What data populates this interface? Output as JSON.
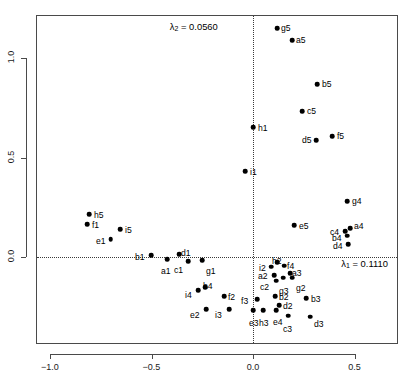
{
  "chart_data": {
    "type": "scatter",
    "title": "",
    "xlabel": "",
    "ylabel": "",
    "xlim": [
      -1.07,
      0.715
    ],
    "ylim": [
      -0.44,
      1.22
    ],
    "xticks": [
      -1.0,
      -0.5,
      0.0,
      0.5
    ],
    "xticklabels": [
      "-1.0",
      "-0.5",
      "0.0",
      "0.5"
    ],
    "yticks": [
      0.0,
      0.5,
      1.0
    ],
    "yticklabels": [
      "0.0",
      "0.5",
      "1.0"
    ],
    "grid": false,
    "reference_lines": {
      "vertical_x": 0.0,
      "horizontal_y": 0.0,
      "style": "dotted"
    },
    "annotations": [
      {
        "name": "lambda2",
        "text": "λ₂ = 0.0560",
        "x": -0.055,
        "y": 1.155,
        "align": "right"
      },
      {
        "name": "lambda1",
        "text": "λ₁ = 0.1110",
        "x": 0.435,
        "y": -0.035,
        "align": "left"
      }
    ],
    "point_labels": [
      "a1",
      "b1",
      "c1",
      "d1",
      "e1",
      "f1",
      "g1",
      "h5",
      "i5",
      "a2",
      "b2",
      "c2",
      "d2",
      "e2",
      "f2",
      "g2",
      "h2",
      "i2",
      "a3",
      "b3",
      "c3",
      "d3",
      "e3",
      "f3",
      "g3",
      "h3",
      "i3",
      "a4",
      "b4",
      "c4",
      "d4",
      "e4",
      "f4",
      "g4",
      "h4",
      "i4",
      "a5",
      "b5",
      "c5",
      "d5",
      "e5",
      "f5",
      "g5",
      "h1",
      "i1"
    ],
    "points": [
      {
        "label": "g5",
        "x": 0.118,
        "y": 1.151,
        "lx": 4,
        "ly": -4
      },
      {
        "label": "a5",
        "x": 0.192,
        "y": 1.09,
        "lx": 4,
        "ly": -4
      },
      {
        "label": "b5",
        "x": 0.315,
        "y": 0.869,
        "lx": 5,
        "ly": -4
      },
      {
        "label": "c5",
        "x": 0.241,
        "y": 0.734,
        "lx": 5,
        "ly": -4
      },
      {
        "label": "f5",
        "x": 0.389,
        "y": 0.608,
        "lx": 5,
        "ly": -4
      },
      {
        "label": "d5",
        "x": 0.31,
        "y": 0.588,
        "lx": -14,
        "ly": -4
      },
      {
        "label": "h1",
        "x": 0.0,
        "y": 0.653,
        "lx": 5,
        "ly": -3
      },
      {
        "label": "i1",
        "x": -0.039,
        "y": 0.432,
        "lx": 5,
        "ly": -3
      },
      {
        "label": "g4",
        "x": 0.463,
        "y": 0.281,
        "lx": 5,
        "ly": -4
      },
      {
        "label": "a4",
        "x": 0.478,
        "y": 0.146,
        "lx": 4,
        "ly": -6
      },
      {
        "label": "c4",
        "x": 0.453,
        "y": 0.131,
        "lx": -15,
        "ly": -3
      },
      {
        "label": "b4",
        "x": 0.463,
        "y": 0.106,
        "lx": -15,
        "ly": -2
      },
      {
        "label": "d4",
        "x": 0.468,
        "y": 0.065,
        "lx": -15,
        "ly": -2
      },
      {
        "label": "e5",
        "x": 0.202,
        "y": 0.161,
        "lx": 5,
        "ly": -3
      },
      {
        "label": "h5",
        "x": -0.808,
        "y": 0.216,
        "lx": 5,
        "ly": -3
      },
      {
        "label": "f1",
        "x": -0.818,
        "y": 0.166,
        "lx": 5,
        "ly": -3
      },
      {
        "label": "i5",
        "x": -0.655,
        "y": 0.141,
        "lx": 5,
        "ly": -3
      },
      {
        "label": "e1",
        "x": -0.7,
        "y": 0.09,
        "lx": -15,
        "ly": -2
      },
      {
        "label": "b1",
        "x": -0.502,
        "y": 0.01,
        "lx": -16,
        "ly": -2
      },
      {
        "label": "a1",
        "x": -0.424,
        "y": -0.01,
        "lx": -6,
        "ly": 8
      },
      {
        "label": "d1",
        "x": -0.364,
        "y": 0.015,
        "lx": 2,
        "ly": -5
      },
      {
        "label": "c1",
        "x": -0.32,
        "y": -0.02,
        "lx": -14,
        "ly": 5
      },
      {
        "label": "g1",
        "x": -0.251,
        "y": -0.015,
        "lx": 4,
        "ly": 7
      },
      {
        "label": "h2",
        "x": 0.118,
        "y": -0.025,
        "lx": -5,
        "ly": -5
      },
      {
        "label": "i2",
        "x": 0.089,
        "y": -0.049,
        "lx": -12,
        "ly": 0
      },
      {
        "label": "f4",
        "x": 0.153,
        "y": -0.044,
        "lx": 3,
        "ly": -4
      },
      {
        "label": "a3",
        "x": 0.182,
        "y": -0.08,
        "lx": 2,
        "ly": -4
      },
      {
        "label": "a2",
        "x": 0.103,
        "y": -0.09,
        "lx": -16,
        "ly": 0
      },
      {
        "label": "g3",
        "x": 0.148,
        "y": -0.105,
        "lx": -4,
        "ly": 9
      },
      {
        "label": "g2",
        "x": 0.192,
        "y": -0.105,
        "lx": 4,
        "ly": 6
      },
      {
        "label": "c2",
        "x": 0.113,
        "y": -0.12,
        "lx": -16,
        "ly": 2
      },
      {
        "label": "b2",
        "x": 0.108,
        "y": -0.196,
        "lx": 4,
        "ly": -3
      },
      {
        "label": "b3",
        "x": 0.261,
        "y": -0.206,
        "lx": 5,
        "ly": -3
      },
      {
        "label": "f3",
        "x": 0.02,
        "y": -0.211,
        "lx": -16,
        "ly": -2
      },
      {
        "label": "d2",
        "x": 0.128,
        "y": -0.241,
        "lx": 4,
        "ly": -3
      },
      {
        "label": "e4",
        "x": 0.113,
        "y": -0.266,
        "lx": -3,
        "ly": 8
      },
      {
        "label": "h3",
        "x": 0.049,
        "y": -0.266,
        "lx": -4,
        "ly": 9
      },
      {
        "label": "e3",
        "x": 0.0,
        "y": -0.266,
        "lx": -4,
        "ly": 9
      },
      {
        "label": "c3",
        "x": 0.172,
        "y": -0.296,
        "lx": -5,
        "ly": 9
      },
      {
        "label": "d3",
        "x": 0.281,
        "y": -0.301,
        "lx": 4,
        "ly": 3
      },
      {
        "label": "i3",
        "x": -0.118,
        "y": -0.261,
        "lx": -14,
        "ly": 2
      },
      {
        "label": "e2",
        "x": -0.231,
        "y": -0.261,
        "lx": -16,
        "ly": 2
      },
      {
        "label": "f2",
        "x": -0.143,
        "y": -0.196,
        "lx": 4,
        "ly": -3
      },
      {
        "label": "h4",
        "x": -0.236,
        "y": -0.151,
        "lx": -2,
        "ly": -5
      },
      {
        "label": "i4",
        "x": -0.271,
        "y": -0.166,
        "lx": -13,
        "ly": 1
      }
    ]
  },
  "geometry": {
    "frame": {
      "left": 36,
      "top": 15,
      "right": 398,
      "bottom": 344
    },
    "x_origin_px": 253,
    "x_scale_px": 203,
    "y_origin_px": 257,
    "y_scale_px": 199
  }
}
